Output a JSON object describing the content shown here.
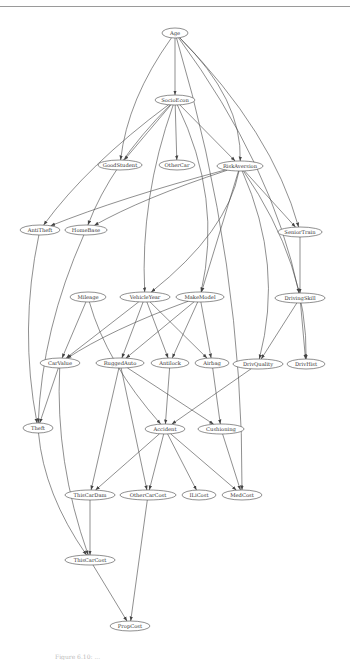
{
  "figure": {
    "caption": "Figure 6.10: ...",
    "type": "bayesian-network"
  },
  "nodes": [
    {
      "id": "Age",
      "label": "Age",
      "x": 175,
      "y": 33,
      "rx": 13
    },
    {
      "id": "SocioEcon",
      "label": "SocioEcon",
      "x": 175,
      "y": 100,
      "rx": 20
    },
    {
      "id": "GoodStudent",
      "label": "GoodStudent",
      "x": 120,
      "y": 165,
      "rx": 22
    },
    {
      "id": "OtherCar",
      "label": "OtherCar",
      "x": 177,
      "y": 165,
      "rx": 18
    },
    {
      "id": "RiskAversion",
      "label": "RiskAversion",
      "x": 240,
      "y": 166,
      "rx": 23
    },
    {
      "id": "AntiTheft",
      "label": "AntiTheft",
      "x": 40,
      "y": 230,
      "rx": 20
    },
    {
      "id": "HomeBase",
      "label": "HomeBase",
      "x": 86,
      "y": 230,
      "rx": 21
    },
    {
      "id": "SeniorTrain",
      "label": "SeniorTrain",
      "x": 300,
      "y": 232,
      "rx": 22
    },
    {
      "id": "Mileage",
      "label": "Mileage",
      "x": 88,
      "y": 297,
      "rx": 18
    },
    {
      "id": "VehicleYear",
      "label": "VehicleYear",
      "x": 145,
      "y": 297,
      "rx": 25
    },
    {
      "id": "MakeModel",
      "label": "MakeModel",
      "x": 200,
      "y": 297,
      "rx": 24
    },
    {
      "id": "DrivingSkill",
      "label": "DrivingSkill",
      "x": 300,
      "y": 298,
      "rx": 25
    },
    {
      "id": "CarValue",
      "label": "CarValue",
      "x": 60,
      "y": 363,
      "rx": 20
    },
    {
      "id": "RuggedAuto",
      "label": "RuggedAuto",
      "x": 120,
      "y": 363,
      "rx": 24
    },
    {
      "id": "Antilock",
      "label": "Antilock",
      "x": 170,
      "y": 363,
      "rx": 19
    },
    {
      "id": "Airbag",
      "label": "Airbag",
      "x": 212,
      "y": 363,
      "rx": 17
    },
    {
      "id": "DrivQuality",
      "label": "DrivQuality",
      "x": 258,
      "y": 364,
      "rx": 25
    },
    {
      "id": "DrivHist",
      "label": "DrivHist",
      "x": 306,
      "y": 364,
      "rx": 19
    },
    {
      "id": "Theft",
      "label": "Theft",
      "x": 38,
      "y": 428,
      "rx": 15
    },
    {
      "id": "Accident",
      "label": "Accident",
      "x": 165,
      "y": 429,
      "rx": 20
    },
    {
      "id": "Cushioning",
      "label": "Cushioning",
      "x": 221,
      "y": 429,
      "rx": 23
    },
    {
      "id": "ThisCarDam",
      "label": "ThisCarDam",
      "x": 90,
      "y": 495,
      "rx": 25
    },
    {
      "id": "OtherCarCost",
      "label": "OtherCarCost",
      "x": 148,
      "y": 495,
      "rx": 28
    },
    {
      "id": "ILiCost",
      "label": "ILiCost",
      "x": 199,
      "y": 495,
      "rx": 17
    },
    {
      "id": "MedCost",
      "label": "MedCost",
      "x": 242,
      "y": 495,
      "rx": 20
    },
    {
      "id": "ThisCarCost",
      "label": "ThisCarCost",
      "x": 90,
      "y": 560,
      "rx": 25
    },
    {
      "id": "PropCost",
      "label": "PropCost",
      "x": 130,
      "y": 626,
      "rx": 20
    }
  ],
  "edges": [
    [
      "Age",
      "SocioEcon"
    ],
    [
      "Age",
      "GoodStudent"
    ],
    [
      "Age",
      "RiskAversion"
    ],
    [
      "Age",
      "SeniorTrain"
    ],
    [
      "Age",
      "DrivingSkill"
    ],
    [
      "Age",
      "MedCost"
    ],
    [
      "SocioEcon",
      "GoodStudent"
    ],
    [
      "SocioEcon",
      "OtherCar"
    ],
    [
      "SocioEcon",
      "RiskAversion"
    ],
    [
      "SocioEcon",
      "AntiTheft"
    ],
    [
      "SocioEcon",
      "HomeBase"
    ],
    [
      "SocioEcon",
      "VehicleYear"
    ],
    [
      "SocioEcon",
      "MakeModel"
    ],
    [
      "RiskAversion",
      "AntiTheft"
    ],
    [
      "RiskAversion",
      "HomeBase"
    ],
    [
      "RiskAversion",
      "SeniorTrain"
    ],
    [
      "RiskAversion",
      "VehicleYear"
    ],
    [
      "RiskAversion",
      "MakeModel"
    ],
    [
      "RiskAversion",
      "DrivQuality"
    ],
    [
      "RiskAversion",
      "DrivHist"
    ],
    [
      "SeniorTrain",
      "DrivingSkill"
    ],
    [
      "AntiTheft",
      "Theft"
    ],
    [
      "HomeBase",
      "Theft"
    ],
    [
      "Mileage",
      "CarValue"
    ],
    [
      "Mileage",
      "Accident"
    ],
    [
      "VehicleYear",
      "CarValue"
    ],
    [
      "VehicleYear",
      "RuggedAuto"
    ],
    [
      "VehicleYear",
      "Antilock"
    ],
    [
      "VehicleYear",
      "Airbag"
    ],
    [
      "MakeModel",
      "CarValue"
    ],
    [
      "MakeModel",
      "RuggedAuto"
    ],
    [
      "MakeModel",
      "Antilock"
    ],
    [
      "MakeModel",
      "Airbag"
    ],
    [
      "DrivingSkill",
      "DrivQuality"
    ],
    [
      "DrivingSkill",
      "DrivHist"
    ],
    [
      "CarValue",
      "Theft"
    ],
    [
      "CarValue",
      "ThisCarCost"
    ],
    [
      "RuggedAuto",
      "Cushioning"
    ],
    [
      "RuggedAuto",
      "OtherCarCost"
    ],
    [
      "RuggedAuto",
      "ThisCarDam"
    ],
    [
      "Antilock",
      "Accident"
    ],
    [
      "Airbag",
      "Cushioning"
    ],
    [
      "DrivQuality",
      "Accident"
    ],
    [
      "Theft",
      "ThisCarCost"
    ],
    [
      "Accident",
      "ThisCarDam"
    ],
    [
      "Accident",
      "OtherCarCost"
    ],
    [
      "Accident",
      "ILiCost"
    ],
    [
      "Accident",
      "MedCost"
    ],
    [
      "Cushioning",
      "MedCost"
    ],
    [
      "ThisCarDam",
      "ThisCarCost"
    ],
    [
      "ThisCarCost",
      "PropCost"
    ],
    [
      "OtherCarCost",
      "PropCost"
    ]
  ]
}
